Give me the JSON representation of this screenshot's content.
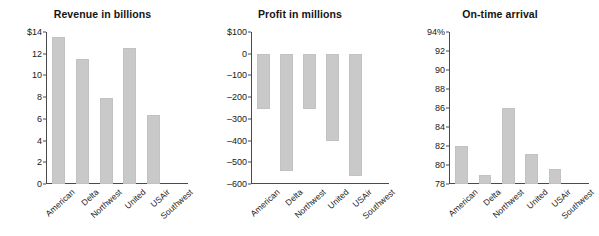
{
  "figure": {
    "background": "#ffffff",
    "bar_color": "#c9c9c9",
    "axis_color": "#4a4a4a",
    "text_color": "#1a1a1a"
  },
  "categories": [
    "American",
    "Delta",
    "Northwest",
    "United",
    "USAir",
    "Southwest"
  ],
  "chart_data": [
    {
      "type": "bar",
      "title": "Revenue in billions",
      "xlabel": "",
      "ylabel": "",
      "categories": [
        "American",
        "Delta",
        "Northwest",
        "United",
        "USAir",
        "Southwest"
      ],
      "values": [
        13.5,
        11.5,
        7.9,
        12.5,
        6.4,
        null
      ],
      "ylim": [
        0,
        14
      ],
      "yticks": [
        0,
        2,
        4,
        6,
        8,
        10,
        12,
        14
      ],
      "ytick_labels": [
        "0",
        "2",
        "4",
        "6",
        "8",
        "10",
        "12",
        "$14"
      ],
      "grid": false,
      "legend": "none"
    },
    {
      "type": "bar",
      "title": "Profit in millions",
      "xlabel": "",
      "ylabel": "",
      "categories": [
        "American",
        "Delta",
        "Northwest",
        "United",
        "USAir",
        "Southwest"
      ],
      "values": [
        -255,
        -540,
        -255,
        -400,
        -565,
        null
      ],
      "ylim": [
        -600,
        100
      ],
      "yticks": [
        -600,
        -500,
        -400,
        -300,
        -200,
        -100,
        0,
        100
      ],
      "ytick_labels": [
        "–600",
        "–500",
        "–400",
        "–300",
        "–200",
        "–100",
        "0",
        "$100"
      ],
      "grid": false,
      "legend": "none"
    },
    {
      "type": "bar",
      "title": "On-time arrival",
      "xlabel": "",
      "ylabel": "",
      "categories": [
        "American",
        "Delta",
        "Northwest",
        "United",
        "USAir",
        "Southwest"
      ],
      "values": [
        82.0,
        79.0,
        86.0,
        81.2,
        79.6,
        null
      ],
      "ylim": [
        78,
        94
      ],
      "yticks": [
        78,
        80,
        82,
        84,
        86,
        88,
        90,
        92,
        94
      ],
      "ytick_labels": [
        "78",
        "80",
        "82",
        "84",
        "86",
        "88",
        "90",
        "92",
        "94%"
      ],
      "grid": false,
      "legend": "none"
    }
  ]
}
